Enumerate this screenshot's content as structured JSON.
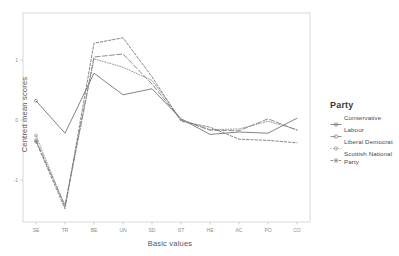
{
  "chart_data": {
    "type": "line",
    "title": "",
    "xlabel": "Basic values",
    "ylabel": "Centred mean scores",
    "categories": [
      "SE",
      "TR",
      "BE",
      "UN",
      "SD",
      "ST",
      "HE",
      "AC",
      "PO",
      "CO"
    ],
    "x_tick_labels": [
      "SE",
      "TR",
      "BE",
      "UN",
      "SD",
      "ST",
      "HE",
      "AC",
      "PO",
      "CO"
    ],
    "y_tick_labels": [
      "1",
      "0",
      "-1"
    ],
    "y_tick_values": [
      1,
      0,
      -1
    ],
    "ylim": [
      -1.55,
      1.45
    ],
    "grid": false,
    "legend_position": "right",
    "legend_title": "Party",
    "series": [
      {
        "name": "Conservative",
        "style": "solid",
        "color": "#6e6e6e",
        "values": [
          0.32,
          -0.22,
          0.78,
          0.42,
          0.52,
          0.02,
          -0.24,
          -0.2,
          -0.22,
          0.03
        ]
      },
      {
        "name": "Labour",
        "style": "longdash",
        "color": "#7a7a7a",
        "values": [
          -0.34,
          -1.42,
          1.05,
          1.1,
          0.6,
          0.0,
          -0.17,
          -0.18,
          0.02,
          -0.17
        ]
      },
      {
        "name": "Liberal Democrat",
        "style": "dotted",
        "color": "#848484",
        "values": [
          -0.26,
          -1.45,
          1.02,
          0.88,
          0.66,
          0.01,
          -0.16,
          -0.15,
          -0.02,
          -0.16
        ]
      },
      {
        "name": "Scottish National Party",
        "style": "dashed",
        "color": "#707070",
        "values": [
          -0.36,
          -1.48,
          1.28,
          1.37,
          0.72,
          -0.02,
          -0.12,
          -0.32,
          -0.34,
          -0.38
        ]
      }
    ]
  },
  "legend": {
    "title": "Party",
    "items": [
      {
        "label": "Conservative",
        "key_icon": "line-marker-icon"
      },
      {
        "label": "Labour",
        "key_icon": "line-marker-icon"
      },
      {
        "label": "Liberal Democrat",
        "key_icon": "line-marker-icon"
      },
      {
        "label": "Scottish National Party",
        "key_icon": "line-marker-icon"
      }
    ]
  },
  "axes": {
    "x_title": "Basic values",
    "y_title": "Centred mean scores"
  },
  "colors": {
    "plot_border": "#cfcfcf",
    "axis_text": "#8c8c8c",
    "title_text": "#555555",
    "legend_title": "#3a3a3a",
    "background": "#ffffff"
  }
}
